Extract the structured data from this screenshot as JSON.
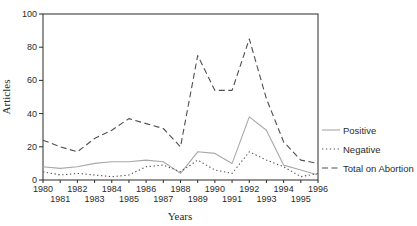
{
  "figure": {
    "background": "#ffffff",
    "axis_color": "#2b2b2b"
  },
  "chart_data": {
    "type": "line",
    "xlabel": "Years",
    "ylabel": "Articles",
    "x": [
      1980,
      1981,
      1982,
      1983,
      1984,
      1985,
      1986,
      1987,
      1988,
      1989,
      1990,
      1991,
      1992,
      1993,
      1994,
      1995,
      1996
    ],
    "xlim": [
      1980,
      1996
    ],
    "ylim": [
      0,
      100
    ],
    "yticks": [
      0,
      20,
      40,
      60,
      80,
      100
    ],
    "grid": false,
    "legend_position": "right-outside",
    "series": [
      {
        "name": "Positive",
        "line_style": "solid",
        "color": "#a8a8a8",
        "values": [
          8,
          7,
          8,
          10,
          11,
          11,
          12,
          11,
          4,
          17,
          16,
          10,
          38,
          30,
          9,
          6,
          3
        ]
      },
      {
        "name": "Negative",
        "line_style": "dotted",
        "color": "#4f4f4f",
        "values": [
          5,
          3,
          4,
          3,
          2,
          3,
          8,
          9,
          5,
          12,
          6,
          4,
          17,
          12,
          8,
          2,
          4
        ]
      },
      {
        "name": "Total on Abortion",
        "line_style": "dashed",
        "color": "#4f4f4f",
        "values": [
          24,
          20,
          17,
          25,
          30,
          37,
          34,
          31,
          20,
          75,
          54,
          54,
          85,
          49,
          23,
          12,
          10
        ]
      }
    ]
  }
}
